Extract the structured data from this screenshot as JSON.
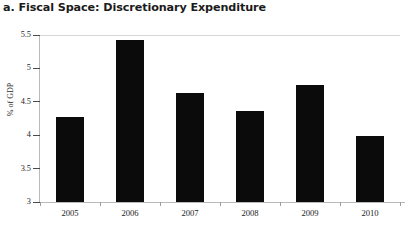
{
  "chart_data": {
    "type": "bar",
    "title": "a. Fiscal Space: Discretionary Expenditure",
    "xlabel": "",
    "ylabel": "% of GDP",
    "categories": [
      "2005",
      "2006",
      "2007",
      "2008",
      "2009",
      "2010"
    ],
    "values": [
      4.27,
      5.42,
      4.63,
      4.36,
      4.75,
      3.99
    ],
    "ylim": [
      3,
      5.5
    ],
    "ytick_labels": [
      "5.5",
      "5",
      "4.5",
      "4",
      "3.5",
      "3"
    ],
    "ytick_values": [
      5.5,
      5,
      4.5,
      4,
      3.5,
      3
    ],
    "grid": false,
    "legend": null,
    "bar_color": "#0b0b0b",
    "axis_color": "#b9b9b9",
    "gridline_color": "#d8d8d8",
    "background": "#ffffff",
    "series": [
      {
        "name": "Discretionary Expenditure",
        "values": [
          4.27,
          5.42,
          4.63,
          4.36,
          4.75,
          3.99
        ]
      }
    ]
  }
}
